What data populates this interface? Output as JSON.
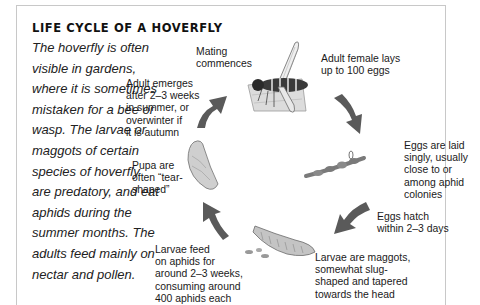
{
  "title": "LIFE CYCLE OF A HOVERFLY",
  "intro": "The hoverfly is often visible in gardens, where it is sometimes mistaken for a bee or wasp. The larvae or maggots of certain species of hoverfly are predatory, and eat aphids during the summer months. The adults feed mainly on nectar and pollen.",
  "stages": {
    "mating": "Mating\ncommences",
    "adult_lays": "Adult female lays\nup to 100 eggs",
    "eggs_laid": "Eggs are laid\nsingly, usually\nclose to or\namong aphid\ncolonies",
    "eggs_hatch": "Eggs hatch\nwithin 2–3 days",
    "larvae_maggots": "Larvae are maggots,\nsomewhat slug-\nshaped and tapered\ntowards the head",
    "larvae_feed": "Larvae feed\non aphids for\naround 2–3 weeks,\nconsuming around\n400 aphids each",
    "pupa": "Pupa are\noften “tear-\nshaped”",
    "adult_emerges": "Adult emerges\nafter 2–3 weeks\nin summer, or\noverwinter if\nit is autumn"
  },
  "illustrations": [
    "adult-hoverfly",
    "eggs-on-stem",
    "larva-maggot",
    "pupa"
  ],
  "colors": {
    "arrow": "#5a5a5a",
    "border": "#c8c8c8",
    "text": "#1a1a1a"
  }
}
